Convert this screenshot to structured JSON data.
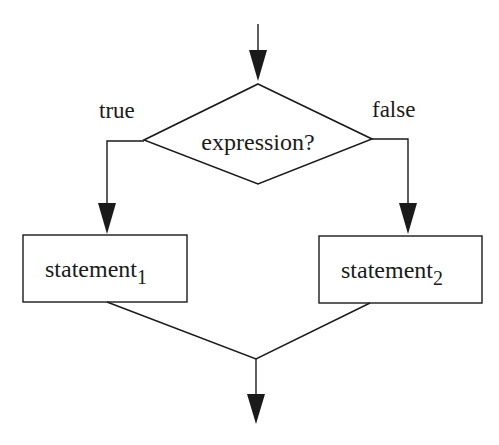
{
  "diagram": {
    "type": "flowchart",
    "title": "",
    "decision": {
      "label": "expression?"
    },
    "branches": {
      "true": {
        "label": "true"
      },
      "false": {
        "label": "false"
      }
    },
    "statements": [
      {
        "text": "statement",
        "subscript": "1"
      },
      {
        "text": "statement",
        "subscript": "2"
      }
    ],
    "colors": {
      "stroke": "#1a1a1a",
      "background": "#ffffff"
    }
  }
}
